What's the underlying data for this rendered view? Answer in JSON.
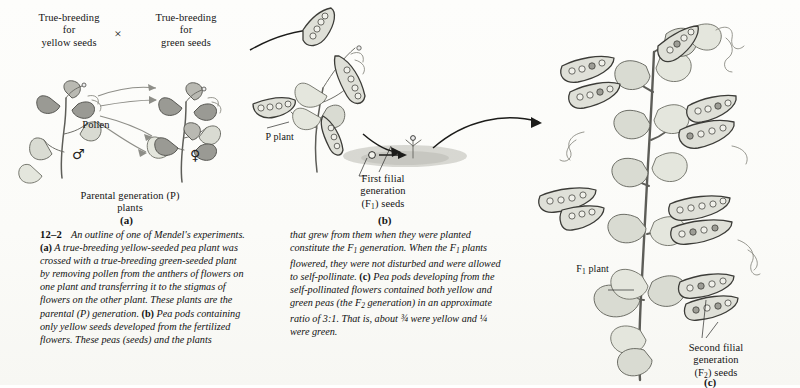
{
  "figure": {
    "number": "12–2",
    "domain": "biology-textbook-figure",
    "background_color": "#fdfdfb",
    "ink_color": "#1a1a1a"
  },
  "panel_a": {
    "letter": "(a)",
    "label_left": "True-breeding\nfor\nyellow seeds",
    "cross_symbol": "×",
    "label_right": "True-breeding\nfor\ngreen seeds",
    "pollen_label": "Pollen",
    "male_symbol": "♂",
    "female_symbol": "♀",
    "caption_label": "Parental generation (P)\nplants"
  },
  "panel_b": {
    "letter": "(b)",
    "p_plant_label": "P plant",
    "f1_seeds_label": "First filial\ngeneration\n(F₁) seeds"
  },
  "panel_c": {
    "letter": "(c)",
    "f1_plant_label": "F₁ plant",
    "f2_seeds_label": "Second filial\ngeneration\n(F₂) seeds"
  },
  "caption": {
    "figure_number": "12–2",
    "left_column": "An outline of one of Mendel's experiments. (a) A true-breeding yellow-seeded pea plant was crossed with a true-breeding green-seeded plant by removing pollen from the anthers of flowers on one plant and transferring it to the stigmas of flowers on the other plant. These plants are the parental (P) generation. (b) Pea pods containing only yellow seeds developed from the fertilized flowers. These peas (seeds) and the plants",
    "right_column": "that grew from them when they were planted constitute the F₁ generation. When the F₁ plants flowered, they were not disturbed and were allowed to self-pollinate. (c) Pea pods developing from the self-pollinated flowers contained both yellow and green peas (the F₂ generation) in an approximate ratio of 3:1. That is, about ¾ were yellow and ¼ were green.",
    "ratio": "3:1",
    "fraction_yellow": "¾",
    "fraction_green": "¼"
  }
}
